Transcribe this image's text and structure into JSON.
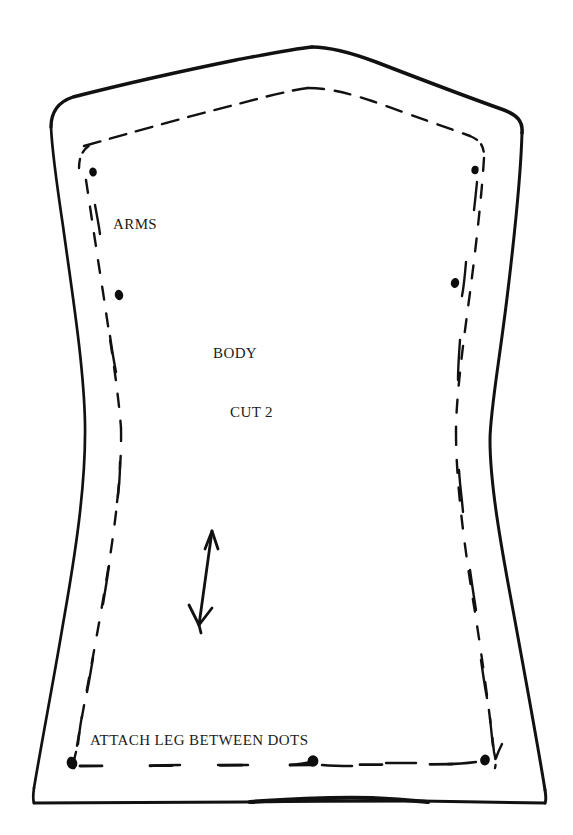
{
  "document": {
    "type": "sewing-pattern-piece",
    "title": "BODY",
    "background_color": "#ffffff",
    "ink_color": "#111111",
    "width": 573,
    "height": 835
  },
  "labels": {
    "arms": "ARMS",
    "body": "BODY",
    "cut": "CUT 2",
    "attach": "ATTACH LEG BETWEEN DOTS"
  },
  "markings": {
    "grainline_name": "grainline-arrow",
    "cutting_line_name": "cutting-line",
    "stitching_line_name": "stitching-line",
    "dot_count": 6
  },
  "geometry": {
    "cutting_line": "M 52 125 C 54 110, 62 100, 76 96 C 140 80, 230 62, 300 50 C 330 45, 350 44, 372 52 C 420 70, 478 92, 510 106 C 521 111, 525 118, 524 130 C 520 200, 508 300, 492 400 C 478 490, 500 610, 524 700 C 534 740, 543 772, 548 792 C 550 800, 548 804, 540 804 L 36 804 C 28 804, 25 800, 27 792 C 34 760, 48 700, 60 640 C 74 570, 86 500, 86 440 C 86 380, 72 280, 60 200 C 55 165, 51 140, 52 125 Z",
    "stitching_line": "M 80 170 C 81 150, 88 140, 100 136 C 160 118, 238 96, 300 86 C 326 82, 344 82, 362 89 C 404 104, 450 122, 472 132 C 482 137, 486 143, 485 155 C 481 220, 470 310, 456 400 C 444 484, 462 600, 482 690 C 489 722, 494 745, 496 760 C 497 768, 494 772, 486 772 L 84 772 C 76 772, 73 768, 74 760 C 80 730, 92 676, 102 620 C 114 558, 124 492, 124 438 C 124 382, 110 288, 98 212 C 93 184, 80 182, 80 170",
    "grainline": {
      "x1": 212,
      "y1": 530,
      "x2": 198,
      "y2": 626
    },
    "dots": [
      {
        "cx": 119,
        "cy": 295,
        "rx": 4.5,
        "ry": 5.5
      },
      {
        "cx": 455,
        "cy": 283,
        "rx": 4.5,
        "ry": 5.5
      },
      {
        "cx": 475,
        "cy": 170,
        "rx": 4.0,
        "ry": 4.5
      },
      {
        "cx": 93,
        "cy": 172,
        "rx": 4.0,
        "ry": 4.5
      },
      {
        "cx": 72,
        "cy": 764,
        "rx": 5.5,
        "ry": 6.5
      },
      {
        "cx": 313,
        "cy": 762,
        "rx": 5.5,
        "ry": 6.0
      },
      {
        "cx": 485,
        "cy": 761,
        "rx": 5.0,
        "ry": 5.5
      }
    ],
    "label_positions": {
      "arms": {
        "x": 113,
        "y": 229
      },
      "body": {
        "x": 213,
        "y": 358
      },
      "cut": {
        "x": 230,
        "y": 417
      },
      "attach": {
        "x": 90,
        "y": 745
      }
    }
  }
}
